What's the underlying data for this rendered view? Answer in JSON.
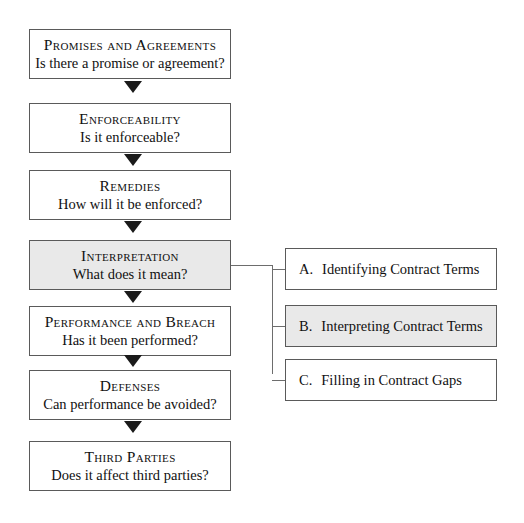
{
  "diagram": {
    "colors": {
      "background": "#ffffff",
      "box_border": "#5a5a5a",
      "box_fill": "#ffffff",
      "highlight_fill": "#e9e9e9",
      "connector": "#6d6d6d",
      "arrow": "#1a1a1a",
      "text": "#111111"
    },
    "spine": [
      {
        "title": "Promises and Agreements",
        "question": "Is there a promise or agreement?",
        "highlighted": false
      },
      {
        "title": "Enforceability",
        "question": "Is it enforceable?",
        "highlighted": false
      },
      {
        "title": "Remedies",
        "question": "How will it be enforced?",
        "highlighted": false
      },
      {
        "title": "Interpretation",
        "question": "What does it mean?",
        "highlighted": true
      },
      {
        "title": "Performance and Breach",
        "question": "Has it been performed?",
        "highlighted": false
      },
      {
        "title": "Defenses",
        "question": "Can performance be avoided?",
        "highlighted": false
      },
      {
        "title": "Third Parties",
        "question": "Does it affect third parties?",
        "highlighted": false
      }
    ],
    "branches": [
      {
        "marker": "A.",
        "label": "Identifying Contract Terms",
        "highlighted": false
      },
      {
        "marker": "B.",
        "label": "Interpreting Contract Terms",
        "highlighted": true
      },
      {
        "marker": "C.",
        "label": "Filling in Contract Gaps",
        "highlighted": false
      }
    ],
    "connector_source": "Interpretation"
  }
}
